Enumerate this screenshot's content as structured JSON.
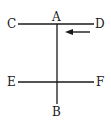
{
  "diagram": {
    "labels": {
      "A": "A",
      "B": "B",
      "C": "C",
      "D": "D",
      "E": "E",
      "F": "F"
    },
    "elements": {
      "wire_ab": "vertical line A-B",
      "wire_cd": "horizontal line C-D",
      "wire_ef": "horizontal line E-F",
      "arrow": "arrow pointing left"
    },
    "colors": {
      "line": "#1a1a1a",
      "background": "#ffffff"
    }
  }
}
